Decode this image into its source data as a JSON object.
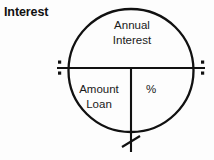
{
  "diagram": {
    "title": "Interest",
    "type": "formula-circle",
    "shape": "circle divided into a top half and two bottom quadrants",
    "top_half": {
      "label": "Annual\nInterest"
    },
    "bottom_left_quadrant": {
      "label": "Amount\nLoan"
    },
    "bottom_right_quadrant": {
      "label": "%"
    },
    "operators": {
      "left_divide": "÷",
      "right_divide": "÷",
      "bottom_multiply": "×"
    },
    "colors": {
      "stroke": "#111111",
      "text": "#1a1a1a",
      "background": "#fdfdfd"
    }
  }
}
